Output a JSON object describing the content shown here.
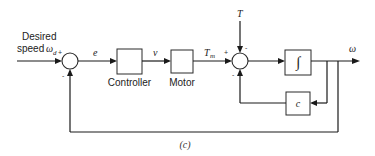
{
  "diagram": {
    "input_label_line1": "Desired",
    "input_label_line2": "speed",
    "input_symbol": "ω",
    "input_subscript": "d",
    "sum1": {
      "sign_in": "+",
      "sign_feedback": "-"
    },
    "signal_error": "e",
    "block_controller": "Controller",
    "signal_voltage": "v",
    "block_motor": "Motor",
    "signal_torque_main": "T",
    "signal_torque_sub": "m",
    "disturbance": "T",
    "sum2": {
      "sign_in": "+",
      "sign_disturbance": "-",
      "sign_feedback": "-"
    },
    "block_integrator": "∫",
    "block_damping": "c",
    "output_label": "ω",
    "caption": "(c)"
  }
}
